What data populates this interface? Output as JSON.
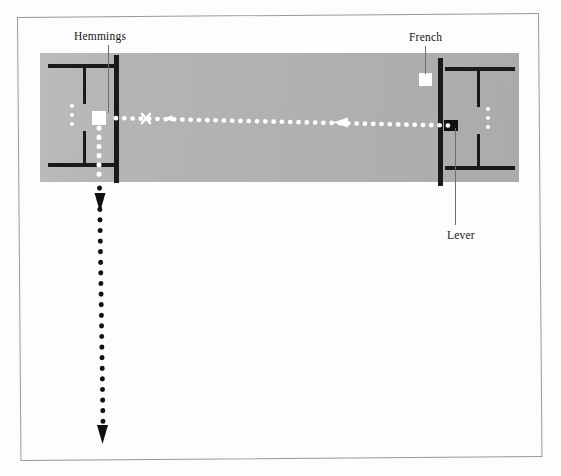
{
  "figure": {
    "kind": "football-pitch-diagram",
    "background_color": "#ffffff",
    "frame_color": "#9a9a9a",
    "pitch_color": "#b4b4b4",
    "line_color": "#1a1a1a"
  },
  "labels": {
    "hemmings": "Hemmings",
    "french": "French",
    "lever": "Lever"
  },
  "markers": {
    "hemmings_player": {
      "type": "white-square",
      "role": "receiving-player"
    },
    "french_player": {
      "type": "white-square",
      "role": "player"
    },
    "lever_player": {
      "type": "black-square",
      "role": "passing-player"
    },
    "shot_x": {
      "type": "x-mark",
      "label": "X"
    }
  },
  "paths": {
    "pass": {
      "name": "ball-pass-path",
      "style": "white-dotted",
      "direction": "right-to-left",
      "from": "Lever",
      "to": "Hemmings"
    },
    "run": {
      "name": "player-run-path",
      "style": "black-dotted",
      "direction": "downward",
      "from": "Hemmings"
    }
  },
  "pitch_features": {
    "goal_dots_left": 3,
    "goal_dots_right": 3,
    "goal_area_left": "six-yard-box",
    "goal_area_right": "six-yard-box"
  }
}
